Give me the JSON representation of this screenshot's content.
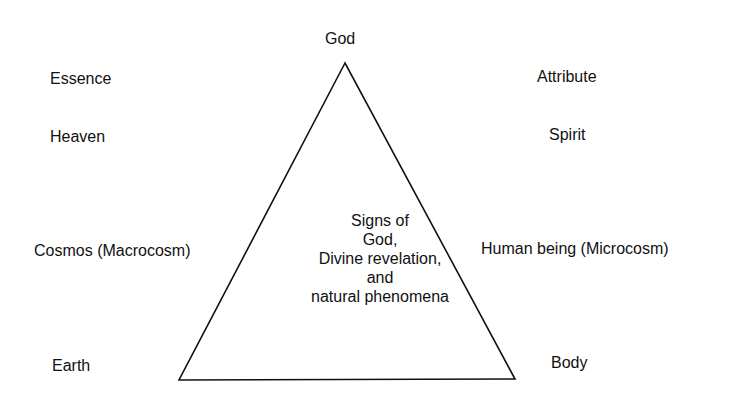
{
  "diagram": {
    "apex_label": "God",
    "left_labels": {
      "essence": "Essence",
      "heaven": "Heaven",
      "cosmos": "Cosmos (Macrocosm)",
      "earth": "Earth"
    },
    "right_labels": {
      "attribute": "Attribute",
      "spirit": "Spirit",
      "human": "Human being (Microcosm)",
      "body": "Body"
    },
    "center_text": {
      "line1": "Signs of",
      "line2": "God,",
      "line3": "Divine revelation,",
      "line4": "and",
      "line5": "natural phenomena"
    },
    "colors": {
      "line": "#111111",
      "background": "#ffffff"
    }
  }
}
